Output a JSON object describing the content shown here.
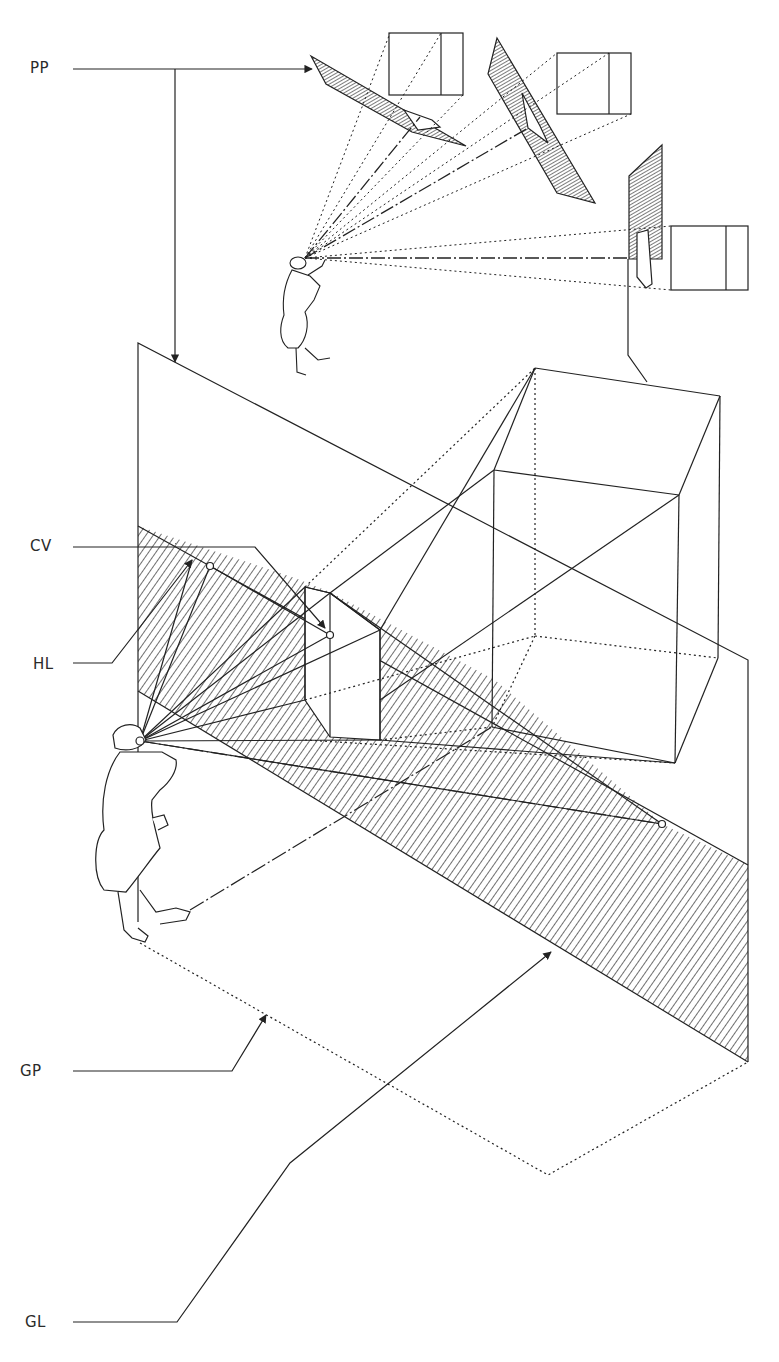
{
  "diagram": {
    "labels": {
      "pp": "PP",
      "cv": "CV",
      "hl": "HL",
      "gp": "GP",
      "gl": "GL"
    },
    "colors": {
      "ink": "#222222",
      "background": "#ffffff"
    }
  }
}
